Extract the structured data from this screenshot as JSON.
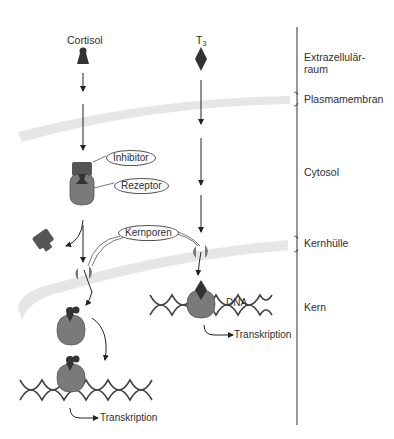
{
  "diagram": {
    "hormones": {
      "cortisol": {
        "label": "Cortisol"
      },
      "t3": {
        "label_main": "T",
        "label_sub": "3"
      }
    },
    "callouts": {
      "inhibitor": "Inhibitor",
      "rezeptor": "Rezeptor",
      "kernporen": "Kernporen",
      "dna": "DNA"
    },
    "transcription_labels": {
      "right": "Transkription",
      "left": "Transkription"
    },
    "compartments": [
      {
        "id": "extrazellulaer",
        "label_line1": "Extrazellulär-",
        "label_line2": "raum"
      },
      {
        "id": "plasmamembran",
        "label": "Plasmamembran"
      },
      {
        "id": "cytosol",
        "label": "Cytosol"
      },
      {
        "id": "kernhuelle",
        "label": "Kernhülle"
      },
      {
        "id": "kern",
        "label": "Kern"
      }
    ],
    "colors": {
      "membrane": "#e6e6e6",
      "receptor": "#7a7a7a",
      "inhibitor": "#555555",
      "hormone": "#333333",
      "line": "#222222"
    }
  }
}
